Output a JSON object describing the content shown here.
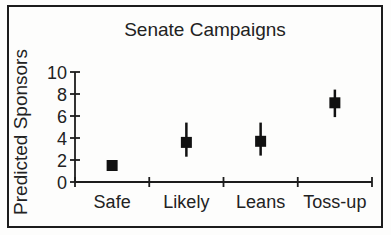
{
  "figure": {
    "background": "#fdfdfc",
    "frame_color": "#1c1c1c",
    "axis_color": "#1c1c1c",
    "text_color": "#222222"
  },
  "chart_data": {
    "type": "scatter",
    "title": "Senate Campaigns",
    "xlabel": "",
    "ylabel": "Predicted Sponsors",
    "categories": [
      "Safe",
      "Likely",
      "Leans",
      "Toss-up"
    ],
    "series": [
      {
        "name": "Predicted Sponsors",
        "marker": "square",
        "marker_color": "#111111",
        "values": [
          1.5,
          3.6,
          3.7,
          7.2
        ],
        "error_low": [
          1.5,
          2.3,
          2.4,
          5.9
        ],
        "error_high": [
          1.5,
          5.4,
          5.4,
          8.4
        ]
      }
    ],
    "ylim": [
      0,
      10
    ],
    "yticks": [
      0,
      2,
      4,
      6,
      8,
      10
    ],
    "grid": false,
    "legend_position": "none"
  }
}
